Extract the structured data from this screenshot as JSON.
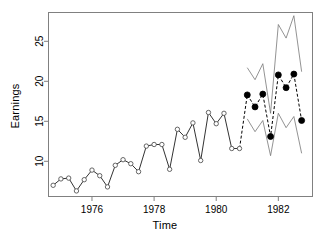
{
  "chart_data": {
    "type": "line",
    "title": "",
    "xlabel": "Time",
    "ylabel": "Earnings",
    "xlim": [
      1974.6,
      1983.1
    ],
    "ylim": [
      5.6,
      28.6
    ],
    "xticks": [
      1976,
      1978,
      1980,
      1982
    ],
    "xtick_labels": [
      "1976",
      "1978",
      "1980",
      "1982"
    ],
    "yticks": [
      10,
      15,
      20,
      25
    ],
    "ytick_labels": [
      "10",
      "15",
      "20",
      "25"
    ],
    "grid": false,
    "legend": "none",
    "box": true,
    "series": [
      {
        "name": "Observed earnings",
        "style": "solid-line-open-circles",
        "marker": "open-circle",
        "color": "#333333",
        "x": [
          1974.75,
          1975.0,
          1975.25,
          1975.5,
          1975.75,
          1976.0,
          1976.25,
          1976.5,
          1976.75,
          1977.0,
          1977.25,
          1977.5,
          1977.75,
          1978.0,
          1978.25,
          1978.5,
          1978.75,
          1979.0,
          1979.25,
          1979.5,
          1979.75,
          1980.0,
          1980.25,
          1980.5,
          1980.75
        ],
        "y": [
          7.0,
          7.8,
          7.9,
          6.3,
          7.7,
          8.9,
          8.2,
          6.8,
          9.5,
          10.2,
          9.7,
          8.7,
          11.9,
          12.1,
          12.1,
          9.0,
          14.0,
          13.0,
          14.8,
          10.1,
          16.1,
          14.7,
          16.0,
          11.6,
          11.6
        ]
      },
      {
        "name": "Forecast",
        "style": "dashed-line-filled-circles",
        "marker": "filled-circle",
        "color": "#000000",
        "x": [
          1981.0,
          1981.25,
          1981.5,
          1981.75,
          1982.0,
          1982.25,
          1982.5,
          1982.75
        ],
        "y": [
          18.3,
          16.8,
          18.4,
          13.1,
          20.8,
          19.2,
          20.9,
          15.1
        ]
      },
      {
        "name": "Upper prediction interval",
        "style": "thin-solid-line",
        "color": "#777777",
        "x": [
          1981.0,
          1981.25,
          1981.5,
          1981.75,
          1982.0,
          1982.25,
          1982.5,
          1982.75
        ],
        "y": [
          21.7,
          20.2,
          22.2,
          16.0,
          27.1,
          25.4,
          28.2,
          21.2
        ]
      },
      {
        "name": "Lower prediction interval",
        "style": "thin-solid-line",
        "color": "#777777",
        "x": [
          1981.0,
          1981.25,
          1981.5,
          1981.75,
          1982.0,
          1982.25,
          1982.5,
          1982.75
        ],
        "y": [
          15.3,
          13.7,
          15.1,
          10.7,
          16.0,
          14.2,
          15.6,
          11.0
        ]
      }
    ]
  }
}
